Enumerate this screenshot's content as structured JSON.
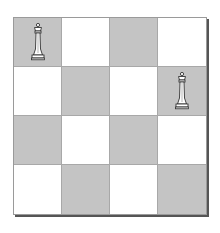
{
  "board": {
    "size": 4,
    "colors": {
      "dark": "#c4c4c4",
      "light": "#ffffff",
      "grid_line": "#a8a8a8",
      "shadow": "#555555"
    },
    "rows": [
      [
        {
          "shade": "dark",
          "piece": "white-queen"
        },
        {
          "shade": "light",
          "piece": null
        },
        {
          "shade": "dark",
          "piece": null
        },
        {
          "shade": "light",
          "piece": null
        }
      ],
      [
        {
          "shade": "light",
          "piece": null
        },
        {
          "shade": "dark",
          "piece": null
        },
        {
          "shade": "light",
          "piece": null
        },
        {
          "shade": "dark",
          "piece": "white-queen"
        }
      ],
      [
        {
          "shade": "dark",
          "piece": null
        },
        {
          "shade": "light",
          "piece": null
        },
        {
          "shade": "dark",
          "piece": null
        },
        {
          "shade": "light",
          "piece": null
        }
      ],
      [
        {
          "shade": "light",
          "piece": null
        },
        {
          "shade": "dark",
          "piece": null
        },
        {
          "shade": "light",
          "piece": null
        },
        {
          "shade": "dark",
          "piece": null
        }
      ]
    ]
  },
  "pieces": [
    {
      "type": "queen",
      "color": "white",
      "row": 0,
      "col": 0
    },
    {
      "type": "queen",
      "color": "white",
      "row": 1,
      "col": 3
    }
  ]
}
